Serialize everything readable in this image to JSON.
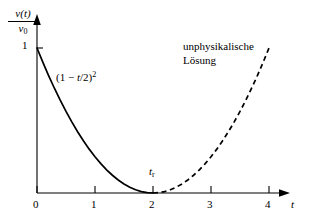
{
  "figure": {
    "background_color": "#ffffff",
    "ink_color": "#000000"
  },
  "axes": {
    "y_label_numerator": "v(t)",
    "y_label_denominator": "v",
    "y_label_denominator_sub": "0",
    "y_tick_label": "1",
    "x_label": "t",
    "x_tick_labels": [
      "0",
      "1",
      "2",
      "3",
      "4"
    ],
    "x_tick_values": [
      0,
      1,
      2,
      3,
      4
    ],
    "y_tick_values": [
      1
    ]
  },
  "annotations": {
    "formula_open": "(1 ",
    "formula_minus": "− ",
    "formula_var": "t",
    "formula_rest": "/2)",
    "formula_exponent": "2",
    "turning_point_label": "t",
    "turning_point_sub": "r",
    "unphysical_line1": "unphysikalische",
    "unphysical_line2": "Lösung"
  },
  "chart_data": {
    "type": "line",
    "title": "",
    "xlabel": "t",
    "ylabel": "v(t)/v0",
    "xlim": [
      0,
      4.3
    ],
    "ylim": [
      0,
      1.15
    ],
    "grid": false,
    "legend": null,
    "xticks": [
      0,
      1,
      2,
      3,
      4
    ],
    "yticks": [
      1
    ],
    "series": [
      {
        "name": "physikalische Lösung",
        "style": "solid",
        "color": "#000000",
        "equation": "(1 - t/2)^2",
        "x": [
          0.0,
          0.1,
          0.2,
          0.3,
          0.4,
          0.5,
          0.6,
          0.7,
          0.8,
          0.9,
          1.0,
          1.1,
          1.2,
          1.3,
          1.4,
          1.5,
          1.6,
          1.7,
          1.8,
          1.9,
          2.0
        ],
        "y": [
          1.0,
          0.9025,
          0.81,
          0.7225,
          0.64,
          0.5625,
          0.49,
          0.4225,
          0.36,
          0.3025,
          0.25,
          0.2025,
          0.16,
          0.1225,
          0.09,
          0.0625,
          0.04,
          0.0225,
          0.01,
          0.0025,
          0.0
        ]
      },
      {
        "name": "unphysikalische Lösung",
        "style": "dashed",
        "color": "#000000",
        "equation": "(1 - t/2)^2",
        "x": [
          2.0,
          2.1,
          2.2,
          2.3,
          2.4,
          2.5,
          2.6,
          2.7,
          2.8,
          2.9,
          3.0,
          3.1,
          3.2,
          3.3,
          3.4,
          3.5,
          3.6,
          3.7,
          3.8,
          3.9,
          4.0
        ],
        "y": [
          0.0,
          0.0025,
          0.01,
          0.0225,
          0.04,
          0.0625,
          0.09,
          0.1225,
          0.16,
          0.2025,
          0.25,
          0.3025,
          0.36,
          0.4225,
          0.49,
          0.5625,
          0.64,
          0.7225,
          0.81,
          0.9025,
          1.0
        ]
      }
    ],
    "annotations": [
      {
        "text": "(1 - t/2)^2",
        "x": 0.35,
        "y": 0.72
      },
      {
        "text": "t_r",
        "x": 1.95,
        "y": 0.2
      },
      {
        "text": "unphysikalische Lösung",
        "x": 2.55,
        "y": 1.02
      }
    ]
  }
}
